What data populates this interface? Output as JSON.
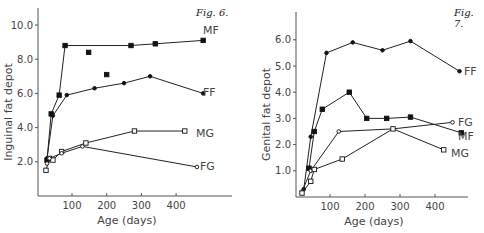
{
  "chart_data": [
    {
      "type": "line",
      "figure_label": "Fig. 6.",
      "title": "",
      "xlabel": "Age (days)",
      "ylabel": "Inguinal fat depot",
      "xticks": [
        100,
        200,
        300,
        400
      ],
      "yticks": [
        "2.0",
        "4.0",
        "6.0",
        "8.0",
        "10.0"
      ],
      "xlim": [
        0,
        490
      ],
      "ylim": [
        0,
        10.5
      ],
      "grid": false,
      "legend": "inline labels at line ends",
      "series": [
        {
          "name": "MF",
          "marker": "filled-square",
          "x": [
            28,
            40,
            63,
            80,
            270,
            340,
            478
          ],
          "y": [
            2.1,
            4.8,
            5.9,
            8.8,
            8.8,
            8.9,
            9.1
          ]
        },
        {
          "name": "MF (unconnected points)",
          "marker": "filled-square",
          "x": [
            148,
            200
          ],
          "y": [
            8.4,
            7.1
          ]
        },
        {
          "name": "FF",
          "marker": "filled-circle",
          "x": [
            28,
            45,
            85,
            165,
            250,
            325,
            478
          ],
          "y": [
            2.2,
            4.7,
            5.9,
            6.3,
            6.6,
            7.0,
            6.0
          ]
        },
        {
          "name": "MG",
          "marker": "open-square",
          "x": [
            25,
            35,
            45,
            70,
            140,
            280,
            425
          ],
          "y": [
            1.5,
            2.2,
            2.1,
            2.6,
            3.1,
            3.8,
            3.8
          ]
        },
        {
          "name": "FG",
          "marker": "open-circle",
          "x": [
            28,
            35,
            70,
            130,
            460
          ],
          "y": [
            1.9,
            2.2,
            2.5,
            2.9,
            1.7
          ]
        }
      ]
    },
    {
      "type": "line",
      "figure_label": "Fig. 7.",
      "title": "",
      "xlabel": "Age (days)",
      "ylabel": "Genital fat depot",
      "xticks": [
        100,
        200,
        300,
        400
      ],
      "yticks": [
        "1.0",
        "2.0",
        "3.0",
        "4.0",
        "5.0",
        "6.0"
      ],
      "xlim": [
        0,
        490
      ],
      "ylim": [
        0,
        7.0
      ],
      "grid": false,
      "legend": "inline labels at line ends",
      "series": [
        {
          "name": "FF",
          "marker": "filled-circle",
          "x": [
            25,
            45,
            90,
            165,
            250,
            330,
            470
          ],
          "y": [
            0.3,
            2.3,
            5.5,
            5.9,
            5.6,
            5.95,
            4.8
          ]
        },
        {
          "name": "MF",
          "marker": "filled-square",
          "x": [
            40,
            55,
            78,
            155,
            205,
            262,
            330,
            475
          ],
          "y": [
            1.1,
            2.5,
            3.35,
            4.0,
            3.0,
            3.0,
            3.05,
            2.45
          ]
        },
        {
          "name": "FG",
          "marker": "open-circle",
          "x": [
            20,
            45,
            125,
            280,
            450
          ],
          "y": [
            0.2,
            1.0,
            2.5,
            2.6,
            2.85
          ]
        },
        {
          "name": "MG",
          "marker": "open-square",
          "x": [
            20,
            45,
            55,
            135,
            280,
            425
          ],
          "y": [
            0.15,
            0.6,
            1.05,
            1.45,
            2.6,
            1.8
          ]
        }
      ]
    }
  ],
  "figures": {
    "fig6": {
      "label": "Fig. 6.",
      "ylabel": "Inguinal fat depot",
      "xlabel": "Age (days)"
    },
    "fig7": {
      "label": "Fig. 7.",
      "ylabel": "Genital fat depot",
      "xlabel": "Age (days)"
    }
  }
}
